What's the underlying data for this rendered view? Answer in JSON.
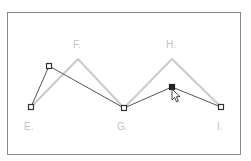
{
  "diagram": {
    "title": "",
    "colors": {
      "frame": "#8a8a8a",
      "guide_path": "#cccccc",
      "edited_path": "#555555",
      "anchor_stroke": "#333333",
      "anchor_fill": "#ffffff",
      "selected_fill": "#222222",
      "label": "#c4c4c4"
    },
    "labels": {
      "E": "E.",
      "F": "F.",
      "G": "G.",
      "H": "H.",
      "I": "I."
    },
    "guide_path_points": [
      {
        "name": "E",
        "x": 31,
        "y": 107
      },
      {
        "name": "F",
        "x": 78,
        "y": 59
      },
      {
        "name": "G",
        "x": 124,
        "y": 108
      },
      {
        "name": "H",
        "x": 172,
        "y": 59
      },
      {
        "name": "I",
        "x": 221,
        "y": 107
      }
    ],
    "edited_path_points": [
      {
        "name": "E",
        "x": 31,
        "y": 107,
        "selected": false
      },
      {
        "name": "F-moved",
        "x": 49,
        "y": 66,
        "selected": false
      },
      {
        "name": "G",
        "x": 124,
        "y": 108,
        "selected": false
      },
      {
        "name": "H-dragged",
        "x": 172,
        "y": 87,
        "selected": true
      },
      {
        "name": "I",
        "x": 221,
        "y": 107,
        "selected": false
      }
    ],
    "cursor": {
      "type": "direct-selection-arrow",
      "x": 173,
      "y": 90
    }
  }
}
